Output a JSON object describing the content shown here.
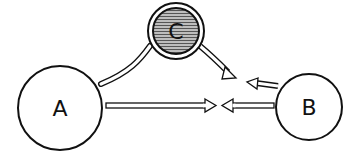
{
  "diagram": {
    "nodes": [
      {
        "id": "A",
        "label": "A",
        "style": "plain"
      },
      {
        "id": "B",
        "label": "B",
        "style": "plain"
      },
      {
        "id": "C",
        "label": "C",
        "style": "shaded-double-ring"
      }
    ],
    "edges": [
      {
        "from": "A",
        "to": "B-side",
        "style": "hollow-arrow",
        "note": "A points right toward B"
      },
      {
        "from": "B",
        "to": "A-side",
        "style": "hollow-arrow",
        "note": "B points left toward A"
      },
      {
        "from": "A",
        "to": "C",
        "style": "hollow-channel",
        "note": "curved tube from A to C"
      },
      {
        "from": "C",
        "to": "center",
        "style": "hollow-arrow",
        "note": "curved arrow from C down toward center"
      },
      {
        "from": "B",
        "to": "center",
        "style": "hollow-arrow",
        "note": "short arrow from B upper-left toward center"
      }
    ],
    "colors": {
      "stroke": "#111111",
      "fill": "#ffffff",
      "shade": "#8a8a8a"
    }
  }
}
